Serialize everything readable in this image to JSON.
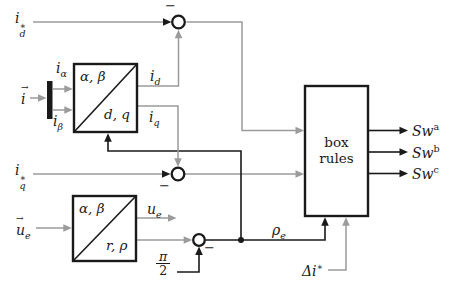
{
  "figure": {
    "background": "#ffffff",
    "signal_gray": "#9b9b9b",
    "line_black": "#1a1a1a"
  },
  "labels": {
    "id_ref": {
      "base": "i",
      "sup": "∗",
      "sub": "d"
    },
    "iq_ref": {
      "base": "i",
      "sup": "∗",
      "sub": "q"
    },
    "i_alpha": {
      "base": "i",
      "sub": "α"
    },
    "i_beta": {
      "base": "i",
      "sub": "β"
    },
    "vec_i": {
      "base": "i",
      "vec": "→"
    },
    "i_d": {
      "base": "i",
      "sub": "d"
    },
    "i_q": {
      "base": "i",
      "sub": "q"
    },
    "vec_ue": {
      "base": "u",
      "vec": "→",
      "sub": "e"
    },
    "u_e": {
      "base": "u",
      "sub": "e"
    },
    "pi_half": {
      "num": "π",
      "den": "2"
    },
    "rho_e": {
      "base": "ρ",
      "sub": "e"
    },
    "delta_i_ref": {
      "base": "Δi",
      "sup": "∗"
    },
    "sw_a": {
      "base": "Sw",
      "sup": "a"
    },
    "sw_b": {
      "base": "Sw",
      "sup": "b"
    },
    "sw_c": {
      "base": "Sw",
      "sup": "c"
    }
  },
  "blocks": {
    "dq_transform": {
      "top_left": "α, β",
      "bottom_right": "d, q"
    },
    "polar_transform": {
      "top_left": "α, β",
      "bottom_right": "r, ρ"
    },
    "box_rules": {
      "line1": "box",
      "line2": "rules"
    }
  },
  "sum_signs": {
    "top_minus": "−",
    "mid_minus": "−",
    "bottom_minus": "−"
  }
}
